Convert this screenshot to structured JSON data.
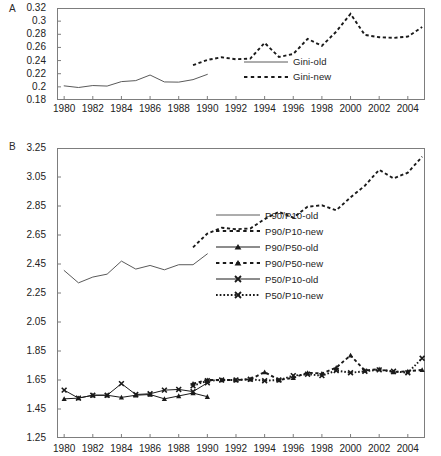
{
  "figure": {
    "panel_a_letter": "A",
    "panel_b_letter": "B"
  },
  "chart_data": [
    {
      "type": "line",
      "panel": "A",
      "title": "",
      "xlabel": "",
      "ylabel": "",
      "xlim": [
        1979.5,
        2005.2
      ],
      "ylim": [
        0.18,
        0.32
      ],
      "yticks": [
        "0.18",
        "0.2",
        "0.22",
        "0.24",
        "0.26",
        "0.28",
        "0.3",
        "0.32"
      ],
      "ytick_values": [
        0.18,
        0.2,
        0.22,
        0.24,
        0.26,
        0.28,
        0.3,
        0.32
      ],
      "xticks": [
        "1980",
        "1982",
        "1984",
        "1986",
        "1988",
        "1990",
        "1992",
        "1994",
        "1996",
        "1998",
        "2000",
        "2002",
        "2004"
      ],
      "xtick_values": [
        1980,
        1982,
        1984,
        1986,
        1988,
        1990,
        1992,
        1994,
        1996,
        1998,
        2000,
        2002,
        2004
      ],
      "grid": false,
      "legend_position": "center-right",
      "series": [
        {
          "name": "Gini-old",
          "style": "solid",
          "marker": "none",
          "color": "#5a5a5a",
          "x": [
            1980,
            1981,
            1982,
            1983,
            1984,
            1985,
            1986,
            1987,
            1988,
            1989,
            1990
          ],
          "values": [
            0.2015,
            0.199,
            0.202,
            0.2012,
            0.208,
            0.2095,
            0.218,
            0.2075,
            0.2072,
            0.211,
            0.219
          ]
        },
        {
          "name": "Gini-new",
          "style": "dashed",
          "marker": "none",
          "color": "#1a1a1a",
          "x": [
            1989,
            1990,
            1991,
            1992,
            1993,
            1994,
            1995,
            1996,
            1997,
            1998,
            1999,
            2000,
            2001,
            2002,
            2003,
            2004,
            2005
          ],
          "values": [
            0.233,
            0.241,
            0.245,
            0.242,
            0.243,
            0.267,
            0.2455,
            0.25,
            0.273,
            0.2625,
            0.284,
            0.311,
            0.279,
            0.2755,
            0.2745,
            0.2765,
            0.291
          ]
        }
      ]
    },
    {
      "type": "line",
      "panel": "B",
      "title": "",
      "xlabel": "",
      "ylabel": "",
      "xlim": [
        1979.5,
        2005.2
      ],
      "ylim": [
        1.25,
        3.25
      ],
      "yticks": [
        "1.25",
        "1.45",
        "1.65",
        "1.85",
        "2.05",
        "2.25",
        "2.45",
        "2.65",
        "2.85",
        "3.05",
        "3.25"
      ],
      "ytick_values": [
        1.25,
        1.45,
        1.65,
        1.85,
        2.05,
        2.25,
        2.45,
        2.65,
        2.85,
        3.05,
        3.25
      ],
      "xticks": [
        "1980",
        "1982",
        "1984",
        "1986",
        "1988",
        "1990",
        "1992",
        "1994",
        "1996",
        "1998",
        "2000",
        "2002",
        "2004"
      ],
      "xtick_values": [
        1980,
        1982,
        1984,
        1986,
        1988,
        1990,
        1992,
        1994,
        1996,
        1998,
        2000,
        2002,
        2004
      ],
      "grid": false,
      "legend_position": "center-right",
      "series": [
        {
          "name": "P90/P10-old",
          "style": "solid",
          "marker": "none",
          "color": "#5a5a5a",
          "x": [
            1980,
            1981,
            1982,
            1983,
            1984,
            1985,
            1986,
            1987,
            1988,
            1989,
            1990
          ],
          "values": [
            2.405,
            2.32,
            2.36,
            2.38,
            2.47,
            2.415,
            2.44,
            2.41,
            2.445,
            2.445,
            2.52
          ]
        },
        {
          "name": "P90/P10-new",
          "style": "dashed",
          "marker": "none",
          "color": "#1a1a1a",
          "x": [
            1989,
            1990,
            1991,
            1992,
            1993,
            1994,
            1995,
            1996,
            1997,
            1998,
            1999,
            2000,
            2001,
            2002,
            2003,
            2004,
            2005
          ],
          "values": [
            2.565,
            2.66,
            2.7,
            2.69,
            2.695,
            2.76,
            2.81,
            2.77,
            2.845,
            2.855,
            2.82,
            2.91,
            2.99,
            3.1,
            3.04,
            3.08,
            3.19
          ]
        },
        {
          "name": "P90/P50-old",
          "style": "solid",
          "marker": "triangle",
          "color": "#1a1a1a",
          "x": [
            1980,
            1981,
            1982,
            1983,
            1984,
            1985,
            1986,
            1987,
            1988,
            1989,
            1990
          ],
          "values": [
            1.52,
            1.525,
            1.545,
            1.545,
            1.53,
            1.545,
            1.55,
            1.52,
            1.54,
            1.56,
            1.535
          ]
        },
        {
          "name": "P90/P50-new",
          "style": "dashed",
          "marker": "triangle",
          "color": "#1a1a1a",
          "x": [
            1989,
            1990,
            1991,
            1992,
            1993,
            1994,
            1995,
            1996,
            1997,
            1998,
            1999,
            2000,
            2001,
            2002,
            2003,
            2004,
            2005
          ],
          "values": [
            1.625,
            1.65,
            1.65,
            1.65,
            1.655,
            1.705,
            1.65,
            1.665,
            1.7,
            1.695,
            1.735,
            1.82,
            1.715,
            1.725,
            1.705,
            1.71,
            1.72
          ]
        },
        {
          "name": "P50/P10-old",
          "style": "solid",
          "marker": "x",
          "color": "#1a1a1a",
          "x": [
            1980,
            1981,
            1982,
            1983,
            1984,
            1985,
            1986,
            1987,
            1988,
            1989,
            1990
          ],
          "values": [
            1.58,
            1.525,
            1.545,
            1.545,
            1.625,
            1.55,
            1.555,
            1.58,
            1.585,
            1.57,
            1.63
          ]
        },
        {
          "name": "P50/P10-new",
          "style": "dotted",
          "marker": "x",
          "color": "#1a1a1a",
          "x": [
            1989,
            1990,
            1991,
            1992,
            1993,
            1994,
            1995,
            1996,
            1997,
            1998,
            1999,
            2000,
            2001,
            2002,
            2003,
            2004,
            2005
          ],
          "values": [
            1.61,
            1.645,
            1.65,
            1.65,
            1.655,
            1.645,
            1.65,
            1.68,
            1.69,
            1.68,
            1.715,
            1.7,
            1.71,
            1.72,
            1.71,
            1.7,
            1.8
          ]
        }
      ]
    }
  ]
}
